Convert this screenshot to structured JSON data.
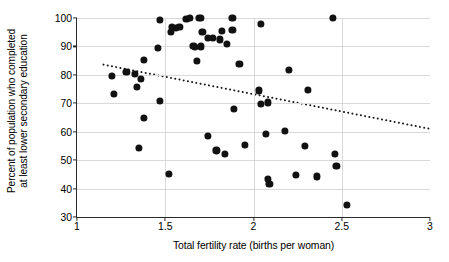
{
  "chart_data": {
    "type": "scatter",
    "title": "",
    "xlabel": "Total fertility rate (births per woman)",
    "ylabel_line1": "Percent of population who completed",
    "ylabel_line2": "at least lower secondary education",
    "xlim": [
      1,
      3
    ],
    "ylim": [
      30,
      100
    ],
    "xticks": [
      1,
      1.5,
      2,
      2.5,
      3
    ],
    "xtick_labels": [
      "1",
      "1.5",
      "2",
      "2.5",
      "3"
    ],
    "yticks": [
      30,
      40,
      50,
      60,
      70,
      80,
      90,
      100
    ],
    "ytick_labels": [
      "30",
      "40",
      "50",
      "60",
      "70",
      "80",
      "90",
      "100"
    ],
    "grid": "horizontal-and-vertical-light",
    "legend": "none",
    "marker_color": "#111111",
    "marker_size_px": 7.2,
    "axis_color": "#2b2b2b",
    "gridline_color": "#d9d9d9",
    "points": [
      {
        "x": 1.2,
        "y": 79.5
      },
      {
        "x": 1.21,
        "y": 73.3
      },
      {
        "x": 1.28,
        "y": 81.0
      },
      {
        "x": 1.33,
        "y": 80.2
      },
      {
        "x": 1.34,
        "y": 75.9
      },
      {
        "x": 1.36,
        "y": 78.5
      },
      {
        "x": 1.35,
        "y": 54.3
      },
      {
        "x": 1.38,
        "y": 85.2
      },
      {
        "x": 1.38,
        "y": 65.0
      },
      {
        "x": 1.46,
        "y": 89.6
      },
      {
        "x": 1.47,
        "y": 70.9
      },
      {
        "x": 1.47,
        "y": 99.2
      },
      {
        "x": 1.52,
        "y": 45.1
      },
      {
        "x": 1.53,
        "y": 95.2
      },
      {
        "x": 1.54,
        "y": 96.9
      },
      {
        "x": 1.56,
        "y": 96.6
      },
      {
        "x": 1.58,
        "y": 96.8
      },
      {
        "x": 1.62,
        "y": 99.7
      },
      {
        "x": 1.64,
        "y": 99.9
      },
      {
        "x": 1.66,
        "y": 90.1
      },
      {
        "x": 1.67,
        "y": 89.9
      },
      {
        "x": 1.68,
        "y": 84.9
      },
      {
        "x": 1.69,
        "y": 100.0
      },
      {
        "x": 1.7,
        "y": 99.9
      },
      {
        "x": 1.7,
        "y": 90.0
      },
      {
        "x": 1.71,
        "y": 95.0
      },
      {
        "x": 1.74,
        "y": 93.0
      },
      {
        "x": 1.74,
        "y": 58.6
      },
      {
        "x": 1.77,
        "y": 92.9
      },
      {
        "x": 1.79,
        "y": 53.4
      },
      {
        "x": 1.81,
        "y": 92.5
      },
      {
        "x": 1.82,
        "y": 95.6
      },
      {
        "x": 1.84,
        "y": 52.3
      },
      {
        "x": 1.85,
        "y": 90.9
      },
      {
        "x": 1.88,
        "y": 100.0
      },
      {
        "x": 1.88,
        "y": 95.8
      },
      {
        "x": 1.89,
        "y": 68.1
      },
      {
        "x": 1.92,
        "y": 83.8
      },
      {
        "x": 1.95,
        "y": 55.3
      },
      {
        "x": 2.03,
        "y": 74.5
      },
      {
        "x": 2.04,
        "y": 69.7
      },
      {
        "x": 2.04,
        "y": 97.9
      },
      {
        "x": 2.07,
        "y": 59.3
      },
      {
        "x": 2.08,
        "y": 70.3
      },
      {
        "x": 2.08,
        "y": 43.3
      },
      {
        "x": 2.09,
        "y": 41.7
      },
      {
        "x": 2.18,
        "y": 60.2
      },
      {
        "x": 2.2,
        "y": 81.6
      },
      {
        "x": 2.24,
        "y": 44.9
      },
      {
        "x": 2.29,
        "y": 55.1
      },
      {
        "x": 2.31,
        "y": 74.7
      },
      {
        "x": 2.36,
        "y": 44.3
      },
      {
        "x": 2.45,
        "y": 100.0
      },
      {
        "x": 2.46,
        "y": 52.2
      },
      {
        "x": 2.47,
        "y": 48.1
      },
      {
        "x": 2.53,
        "y": 34.2
      }
    ],
    "trendline": {
      "style": "dotted",
      "color": "#1a1a1a",
      "x_start": 1.15,
      "y_start": 83.6,
      "x_end": 3.0,
      "y_end": 61.0
    }
  }
}
